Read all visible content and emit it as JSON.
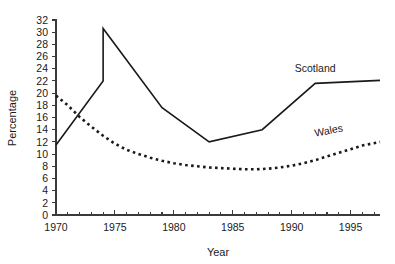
{
  "chart_data": {
    "type": "line",
    "title": "",
    "xlabel": "Year",
    "ylabel": "Percentage",
    "xlim": [
      1970,
      1997.5
    ],
    "ylim": [
      0,
      32
    ],
    "grid": false,
    "legend_position": "inline-end-of-line",
    "x_ticks_major": [
      1970,
      1975,
      1980,
      1985,
      1990,
      1995
    ],
    "x_ticks_major_labels": [
      "1970",
      "1975",
      "1980",
      "1985",
      "1990",
      "1995"
    ],
    "x_ticks_minor": [
      1971,
      1972,
      1973,
      1974,
      1976,
      1977,
      1978,
      1979,
      1981,
      1982,
      1983,
      1984,
      1986,
      1987,
      1988,
      1989,
      1991,
      1992,
      1993,
      1994,
      1996,
      1997
    ],
    "y_ticks": [
      0,
      2,
      4,
      6,
      8,
      10,
      12,
      14,
      16,
      18,
      20,
      22,
      24,
      26,
      28,
      30,
      32
    ],
    "y_tick_labels": [
      "0",
      "2",
      "4",
      "6",
      "8",
      "10",
      "12",
      "14",
      "16",
      "18",
      "20",
      "22",
      "24",
      "26",
      "28",
      "30",
      "32"
    ],
    "series": [
      {
        "name": "Scotland",
        "style": "solid",
        "label_x": 1992.0,
        "label_y": 23.4,
        "label_rotation": 0,
        "x": [
          1970,
          1974,
          1974,
          1979,
          1983,
          1987.5,
          1992,
          1997.5
        ],
        "values": [
          11.5,
          22.0,
          30.6,
          17.6,
          12.0,
          14.0,
          21.6,
          22.1
        ]
      },
      {
        "name": "Wales",
        "style": "dotted",
        "label_x": 1993.2,
        "label_y": 13.3,
        "label_rotation": -11,
        "x": [
          1970,
          1971,
          1972,
          1973,
          1974,
          1975,
          1976,
          1977,
          1978,
          1979,
          1980,
          1981,
          1982,
          1983,
          1984,
          1985,
          1986,
          1987,
          1988,
          1989,
          1990,
          1991,
          1992,
          1993,
          1994,
          1995,
          1996,
          1997.5
        ],
        "values": [
          19.6,
          18.0,
          16.1,
          14.5,
          13.0,
          11.7,
          10.7,
          10.0,
          9.4,
          8.9,
          8.5,
          8.2,
          8.0,
          7.8,
          7.7,
          7.6,
          7.5,
          7.5,
          7.6,
          7.8,
          8.1,
          8.5,
          9.0,
          9.6,
          10.2,
          10.8,
          11.4,
          12.0
        ]
      }
    ],
    "colors": {
      "line": "#1a1a1a",
      "axis": "#3a3a3a",
      "background": "#ffffff",
      "text": "#1a1a1a"
    }
  },
  "geometry": {
    "plot_left": 56,
    "plot_right": 380,
    "plot_top": 20,
    "plot_bottom": 215
  }
}
